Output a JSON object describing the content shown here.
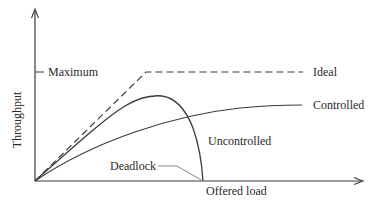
{
  "diagram": {
    "axes": {
      "y_label": "Throughput",
      "x_label": "Offered load",
      "y_tick_label": "Maximum"
    },
    "curves": [
      {
        "name": "ideal",
        "label": "Ideal",
        "style": "dashed"
      },
      {
        "name": "controlled",
        "label": "Controlled",
        "style": "solid"
      },
      {
        "name": "uncontrolled",
        "label": "Uncontrolled",
        "style": "solid"
      }
    ],
    "annotations": {
      "deadlock": "Deadlock"
    },
    "colors": {
      "line": "#3a3a3a",
      "text": "#2a2a2a",
      "leader": "#888888",
      "background": "#ffffff"
    }
  }
}
